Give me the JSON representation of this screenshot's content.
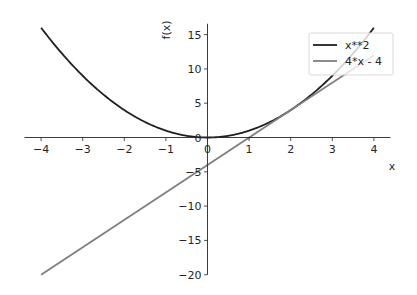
{
  "chart_data": {
    "type": "line",
    "title": "",
    "xlabel": "x",
    "ylabel": "f(x)",
    "xlim": [
      -4.4,
      4.4
    ],
    "ylim": [
      -20,
      16
    ],
    "grid": false,
    "spines": "centered at origin",
    "legend_position": "upper right",
    "x_ticks": [
      -4,
      -3,
      -2,
      -1,
      0,
      1,
      2,
      3,
      4
    ],
    "y_ticks": [
      -20,
      -15,
      -10,
      -5,
      0,
      5,
      10,
      15
    ],
    "x_tick_labels": [
      "−4",
      "−3",
      "−2",
      "−1",
      "0",
      "1",
      "2",
      "3",
      "4"
    ],
    "y_tick_labels": [
      "−20",
      "−15",
      "−10",
      "−5",
      "0",
      "5",
      "10",
      "15"
    ],
    "series": [
      {
        "name": "x**2",
        "color": "#1f1f1f",
        "x": [
          -4,
          -3,
          -2,
          -1,
          0,
          1,
          2,
          3,
          4
        ],
        "values": [
          16,
          9,
          4,
          1,
          0,
          1,
          4,
          9,
          16
        ]
      },
      {
        "name": "4*x - 4",
        "color": "#7f7f7f",
        "x": [
          -4,
          4
        ],
        "values": [
          -20,
          12
        ]
      }
    ]
  },
  "legend": {
    "items": [
      {
        "label": "x**2",
        "color": "#1f1f1f"
      },
      {
        "label": "4*x - 4",
        "color": "#7f7f7f"
      }
    ]
  },
  "axes": {
    "x_label": "x",
    "y_label": "f(x)"
  }
}
